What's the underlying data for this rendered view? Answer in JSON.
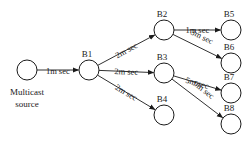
{
  "diagram": {
    "title": "",
    "source": {
      "id": "source",
      "label_lines": [
        "Multicast",
        "source"
      ]
    },
    "nodes": [
      {
        "id": "source",
        "label": ""
      },
      {
        "id": "B1",
        "label": "B1"
      },
      {
        "id": "B2",
        "label": "B2"
      },
      {
        "id": "B3",
        "label": "B3"
      },
      {
        "id": "B4",
        "label": "B4"
      },
      {
        "id": "B5",
        "label": "B5"
      },
      {
        "id": "B6",
        "label": "B6"
      },
      {
        "id": "B7",
        "label": "B7"
      },
      {
        "id": "B8",
        "label": "B8"
      }
    ],
    "edges": [
      {
        "from": "source",
        "to": "B1",
        "label": "1m sec"
      },
      {
        "from": "B1",
        "to": "B2",
        "label": "2m sec"
      },
      {
        "from": "B1",
        "to": "B3",
        "label": "2m sec"
      },
      {
        "from": "B1",
        "to": "B4",
        "label": "2m sec"
      },
      {
        "from": "B2",
        "to": "B5",
        "label": "1m sec"
      },
      {
        "from": "B2",
        "to": "B6",
        "label": "3m sec"
      },
      {
        "from": "B3",
        "to": "B7",
        "label": "5m sec"
      },
      {
        "from": "B3",
        "to": "B8",
        "label": "9m sec"
      }
    ],
    "colors": {
      "stroke": "#1a1a1a",
      "background": "#ffffff"
    }
  }
}
